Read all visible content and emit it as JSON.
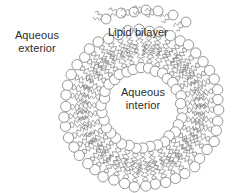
{
  "figure": {
    "width": 234,
    "height": 193,
    "background_color": "#ffffff",
    "stroke_color": "#8a8a8a",
    "text_color": "#2b2b2b"
  },
  "labels": {
    "aqueous_exterior": {
      "line1": "Aqueous",
      "line2": "exterior"
    },
    "lipid_bilayer": {
      "line1": "Lipid bilayer"
    },
    "aqueous_interior": {
      "line1": "Aqueous",
      "line2": "interior"
    }
  },
  "diagram_data": {
    "type": "schematic",
    "structure": "phospholipid bilayer vesicle (liposome)",
    "center": {
      "x": 142,
      "y": 108
    },
    "inner_leaflet_head_radius": 40,
    "outer_leaflet_head_radius": 78,
    "head_circle_radius": 5.2,
    "lipid_count_inner": 34,
    "lipid_count_outer": 46,
    "tail_count_per_lipid": 2,
    "tail_zigzag_segments": 9,
    "free_monomers": [
      {
        "x": 106,
        "y": 19,
        "angle": 200
      },
      {
        "x": 121,
        "y": 13,
        "angle": 185
      },
      {
        "x": 134,
        "y": 12,
        "angle": 175
      },
      {
        "x": 146,
        "y": 10,
        "angle": 180
      },
      {
        "x": 158,
        "y": 11,
        "angle": 170
      },
      {
        "x": 173,
        "y": 15,
        "angle": 160
      },
      {
        "x": 186,
        "y": 22,
        "angle": 150
      }
    ]
  }
}
